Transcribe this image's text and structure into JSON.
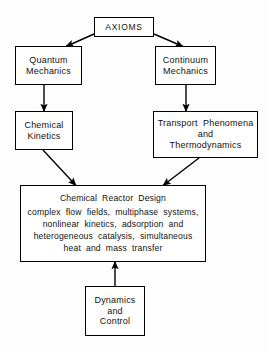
{
  "diagram": {
    "background_color": "#fdfdfd",
    "line_color": "#000000",
    "text_color": "#111111",
    "nodes": {
      "axioms": {
        "label": "AXIOMS",
        "lines": [
          "AXIOMS"
        ]
      },
      "quantum_mechanics": {
        "label": "Quantum Mechanics",
        "lines": [
          "Quantum",
          "Mechanics"
        ]
      },
      "continuum_mechanics": {
        "label": "Continuum Mechanics",
        "lines": [
          "Continuum",
          "Mechanics"
        ]
      },
      "chemical_kinetics": {
        "label": "Chemical Kinetics",
        "lines": [
          "Chemical",
          "Kinetics"
        ]
      },
      "transport_phenomena": {
        "label": "Transport Phenomena and Thermodynamics",
        "lines": [
          "Transport  Phenomena",
          "and",
          "Thermodynamics"
        ]
      },
      "chemical_reactor_design": {
        "label": "Chemical Reactor Design",
        "lines": [
          "Chemical  Reactor  Design",
          "complex  flow  fields,  multiphase  systems,",
          "nonlinear  kinetics,  adsorption  and",
          "heterogeneous  catalysis,  simultaneous",
          "heat  and  mass  transfer"
        ]
      },
      "dynamics_and_control": {
        "label": "Dynamics and Control",
        "lines": [
          "Dynamics",
          "and",
          "Control"
        ]
      }
    },
    "edges": [
      {
        "name": "axioms-to-quantum-mechanics",
        "from": "axioms",
        "to": "quantum_mechanics",
        "style": "diagonal-arrow"
      },
      {
        "name": "axioms-to-continuum-mechanics",
        "from": "axioms",
        "to": "continuum_mechanics",
        "style": "diagonal-arrow"
      },
      {
        "name": "quantum-mechanics-to-chemical-kinetics",
        "from": "quantum_mechanics",
        "to": "chemical_kinetics",
        "style": "vertical-arrow"
      },
      {
        "name": "continuum-mechanics-to-transport",
        "from": "continuum_mechanics",
        "to": "transport_phenomena",
        "style": "vertical-arrow"
      },
      {
        "name": "chemical-kinetics-to-reactor-design",
        "from": "chemical_kinetics",
        "to": "chemical_reactor_design",
        "style": "diagonal-arrow"
      },
      {
        "name": "transport-to-reactor-design",
        "from": "transport_phenomena",
        "to": "chemical_reactor_design",
        "style": "diagonal-arrow"
      },
      {
        "name": "dynamics-control-to-reactor-design",
        "from": "dynamics_and_control",
        "to": "chemical_reactor_design",
        "style": "vertical-arrow-up"
      }
    ]
  }
}
